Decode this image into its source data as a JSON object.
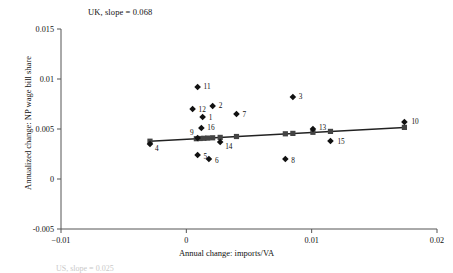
{
  "chart_data": {
    "type": "scatter",
    "title": "UK, slope = 0.068",
    "xlabel": "Annual change: imports/VA",
    "ylabel": "Annualized change: NP wage bill share",
    "xlim": [
      -0.01,
      0.02
    ],
    "ylim": [
      -0.005,
      0.015
    ],
    "xticks": [
      "-0.01",
      "0",
      "0.01",
      "0.02"
    ],
    "xtick_values": [
      -0.01,
      0,
      0.01,
      0.02
    ],
    "yticks": [
      "0.015",
      "0.01",
      "0.005",
      "0",
      "-0.005"
    ],
    "ytick_values": [
      0.015,
      0.01,
      0.005,
      0,
      -0.005
    ],
    "grid": false,
    "legend": "none",
    "marker": "diamond",
    "series": [
      {
        "name": "industries",
        "points": [
          {
            "label": "1",
            "x": 0.0013,
            "y": 0.0062
          },
          {
            "label": "2",
            "x": 0.0021,
            "y": 0.0073
          },
          {
            "label": "3",
            "x": 0.0085,
            "y": 0.0082
          },
          {
            "label": "4",
            "x": -0.0029,
            "y": 0.0035
          },
          {
            "label": "5",
            "x": 0.0009,
            "y": 0.0024
          },
          {
            "label": "6",
            "x": 0.0018,
            "y": 0.002
          },
          {
            "label": "7",
            "x": 0.004,
            "y": 0.0065
          },
          {
            "label": "8",
            "x": 0.0079,
            "y": 0.002
          },
          {
            "label": "9",
            "x": 0.0009,
            "y": 0.0041
          },
          {
            "label": "10",
            "x": 0.0174,
            "y": 0.0057
          },
          {
            "label": "11",
            "x": 0.0009,
            "y": 0.0092
          },
          {
            "label": "12",
            "x": 0.0005,
            "y": 0.007
          },
          {
            "label": "13",
            "x": 0.0101,
            "y": 0.005
          },
          {
            "label": "14",
            "x": 0.0027,
            "y": 0.0037
          },
          {
            "label": "15",
            "x": 0.0115,
            "y": 0.0038
          },
          {
            "label": "16",
            "x": 0.0012,
            "y": 0.0051
          }
        ]
      },
      {
        "name": "fitted-line-markers",
        "marker": "square",
        "points": [
          {
            "x": -0.0029,
            "y": 0.00378
          },
          {
            "x": 0.0008,
            "y": 0.00403
          },
          {
            "x": 0.0011,
            "y": 0.00405
          },
          {
            "x": 0.0014,
            "y": 0.00407
          },
          {
            "x": 0.0017,
            "y": 0.00409
          },
          {
            "x": 0.0021,
            "y": 0.00412
          },
          {
            "x": 0.0027,
            "y": 0.00416
          },
          {
            "x": 0.004,
            "y": 0.00425
          },
          {
            "x": 0.0079,
            "y": 0.00452
          },
          {
            "x": 0.0085,
            "y": 0.00456
          },
          {
            "x": 0.0101,
            "y": 0.00467
          },
          {
            "x": 0.0115,
            "y": 0.00476
          },
          {
            "x": 0.0174,
            "y": 0.00516
          }
        ]
      }
    ],
    "fit_line": {
      "name": "regression-line",
      "slope": 0.068,
      "x0": -0.0029,
      "y0": 0.00378,
      "x1": 0.0174,
      "y1": 0.00516
    },
    "footnote": "US, slope = 0.025"
  }
}
